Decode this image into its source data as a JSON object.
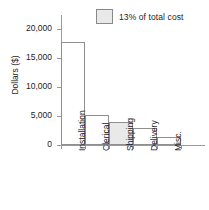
{
  "chart_data": {
    "type": "bar",
    "title": "",
    "xlabel": "",
    "ylabel": "Dollars ($)",
    "categories": [
      "Installation",
      "Clerical",
      "Shipping",
      "Delivery",
      "Misc."
    ],
    "values": [
      17700,
      5200,
      3900,
      2900,
      1400
    ],
    "ylim": [
      0,
      20000
    ],
    "ytick_labels": [
      "0",
      "5,000",
      "10,000",
      "15,000",
      "20,000"
    ],
    "ytick_values": [
      0,
      5000,
      10000,
      15000,
      20000
    ],
    "grid": false,
    "legend_position": "top-right",
    "legend": [
      {
        "label": "13% of total cost",
        "swatch_color": "#e9e9e9",
        "swatch_border": "#8a8a8a",
        "applies_to": "Shipping"
      }
    ],
    "highlighted_category": "Shipping",
    "bar_fill": "#ffffff",
    "bar_border": "#8f8f8f",
    "axis_color": "#9a9a9a",
    "text_color": "#1c1c1c"
  }
}
